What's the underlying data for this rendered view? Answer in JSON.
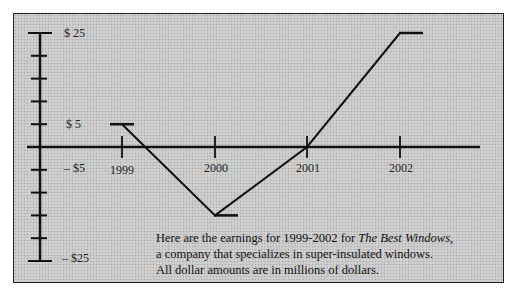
{
  "chart_data": {
    "type": "line",
    "title": "",
    "categories": [
      "1999",
      "2000",
      "2001",
      "2002"
    ],
    "values": [
      5,
      -15,
      0,
      25
    ],
    "xlabel": "",
    "ylabel": "",
    "ylim": [
      -25,
      25
    ],
    "y_tick_step": 5,
    "y_tick_labels": [
      "$ 25",
      "$ 5",
      "– $5",
      "– $25"
    ],
    "grid": false,
    "legend": null
  },
  "caption": {
    "line1_pre": "Here are the earnings for 1999-2002 for ",
    "line1_italic": "The Best Windows,",
    "line2": "a company that specializes in super-insulated windows.",
    "line3": "All dollar amounts are in millions of dollars."
  }
}
